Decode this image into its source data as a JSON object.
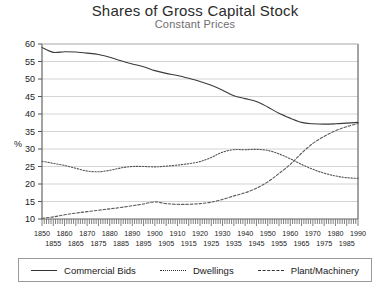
{
  "chart_data": {
    "type": "line",
    "title": "Shares of Gross Capital Stock",
    "subtitle": "Constant Prices",
    "xlabel": "",
    "ylabel": "%",
    "ylim": [
      10,
      60
    ],
    "xlim": [
      1850,
      1990
    ],
    "ytick_step": 5,
    "yticks": [
      10,
      15,
      20,
      25,
      30,
      35,
      40,
      45,
      50,
      55,
      60
    ],
    "xticks_top_row": [
      1850,
      1860,
      1870,
      1880,
      1890,
      1900,
      1910,
      1920,
      1930,
      1940,
      1950,
      1960,
      1970,
      1980,
      1990
    ],
    "xticks_bottom_row": [
      1855,
      1865,
      1875,
      1885,
      1895,
      1905,
      1915,
      1925,
      1935,
      1945,
      1955,
      1965,
      1975,
      1985
    ],
    "grid": "horizontal",
    "legend_position": "bottom",
    "minor_ticks": "annual",
    "x": [
      1850,
      1855,
      1860,
      1865,
      1870,
      1875,
      1880,
      1885,
      1890,
      1895,
      1900,
      1905,
      1910,
      1915,
      1920,
      1925,
      1930,
      1935,
      1940,
      1945,
      1950,
      1955,
      1960,
      1965,
      1970,
      1975,
      1980,
      1985,
      1990
    ],
    "series": [
      {
        "name": "Commercial Bids",
        "style": "solid",
        "color": "#3a3a3a",
        "values": [
          59.0,
          57.6,
          57.8,
          57.7,
          57.4,
          57.0,
          56.2,
          55.2,
          54.3,
          53.5,
          52.4,
          51.6,
          51.0,
          50.2,
          49.3,
          48.2,
          46.8,
          45.2,
          44.4,
          43.6,
          42.0,
          40.2,
          38.8,
          37.6,
          37.2,
          37.1,
          37.2,
          37.4,
          37.6
        ]
      },
      {
        "name": "Dwellings",
        "style": "dotted",
        "color": "#555555",
        "values": [
          26.5,
          25.9,
          25.3,
          24.5,
          23.7,
          23.5,
          23.9,
          24.6,
          25.0,
          25.0,
          24.9,
          25.1,
          25.4,
          25.8,
          26.4,
          27.6,
          29.1,
          29.8,
          29.8,
          29.9,
          29.6,
          28.6,
          27.2,
          25.6,
          24.2,
          23.1,
          22.3,
          21.8,
          21.6
        ]
      },
      {
        "name": "Plant/Machinery",
        "style": "dashed",
        "color": "#5a5a5a",
        "values": [
          10.2,
          10.6,
          11.2,
          11.7,
          12.1,
          12.5,
          12.9,
          13.3,
          13.8,
          14.3,
          14.9,
          14.4,
          14.2,
          14.2,
          14.4,
          14.8,
          15.6,
          16.6,
          17.5,
          18.8,
          20.6,
          23.0,
          25.6,
          28.8,
          31.6,
          33.6,
          35.2,
          36.4,
          37.3
        ]
      }
    ]
  },
  "legend": {
    "items": [
      {
        "label": "Commercial Bids",
        "style": "solid"
      },
      {
        "label": "Dwellings",
        "style": "dotted"
      },
      {
        "label": "Plant/Machinery",
        "style": "dashed"
      }
    ]
  }
}
